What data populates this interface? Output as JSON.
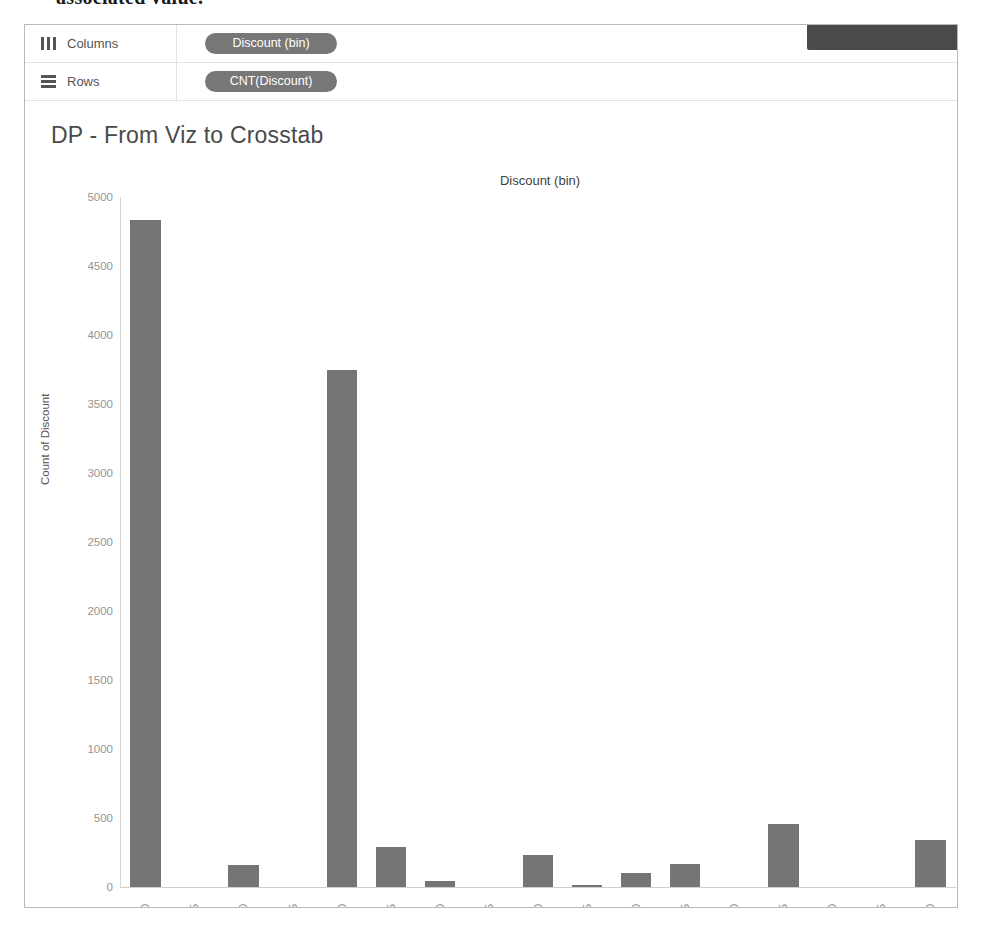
{
  "page_text_fragment": "associated value.",
  "shelves": [
    {
      "icon": "columns-icon",
      "label": "Columns",
      "pill": "Discount (bin)"
    },
    {
      "icon": "rows-icon",
      "label": "Rows",
      "pill": "CNT(Discount)"
    }
  ],
  "viz": {
    "title": "DP - From Viz to Crosstab",
    "column_header": "Discount (bin)"
  },
  "colors": {
    "bar": "#757575",
    "pill": "#777777",
    "toolbar_stub": "#4a4a4a",
    "axis_text": "#949494",
    "title_text": "#4a4a4a"
  },
  "chart_data": {
    "type": "bar",
    "title": "DP - From Viz to Crosstab",
    "xlabel": "Discount (bin)",
    "ylabel": "Count of Discount",
    "ylim": [
      0,
      5000
    ],
    "yticks": [
      5000,
      4500,
      4000,
      3500,
      3000,
      2500,
      2000,
      1500,
      1000,
      500,
      0
    ],
    "grid": false,
    "legend": "none",
    "categories": [
      "0.00",
      "0.05",
      "0.10",
      "0.15",
      "0.20",
      "0.25",
      "0.30",
      "0.35",
      "0.40",
      "0.45",
      "0.50",
      "0.55",
      "0.60",
      "0.65",
      "0.70",
      "0.75",
      "0.80"
    ],
    "values": [
      4830,
      0,
      160,
      0,
      3750,
      290,
      40,
      0,
      230,
      10,
      100,
      170,
      0,
      460,
      0,
      0,
      340
    ]
  }
}
